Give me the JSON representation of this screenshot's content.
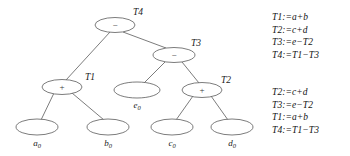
{
  "figure": {
    "kind": "expression-tree-with-code",
    "background": "#ffffff",
    "stroke_color": "#5a5a5a",
    "text_color": "#1a1a1a"
  },
  "tree": {
    "nodes": [
      {
        "id": "T4",
        "operator": "−",
        "tag": "T4",
        "cx": 115,
        "cy": 25,
        "rx": 20,
        "ry": 7.5,
        "tag_x": 133,
        "tag_y": 15,
        "kind": "operator"
      },
      {
        "id": "T3",
        "operator": "−",
        "tag": "T3",
        "cx": 174,
        "cy": 55,
        "rx": 21,
        "ry": 7.5,
        "tag_x": 191,
        "tag_y": 46,
        "kind": "operator"
      },
      {
        "id": "T1",
        "operator": "+",
        "tag": "T1",
        "cx": 62,
        "cy": 87,
        "rx": 20,
        "ry": 7.5,
        "tag_x": 85,
        "tag_y": 80,
        "kind": "operator"
      },
      {
        "id": "T2",
        "operator": "+",
        "tag": "T2",
        "cx": 202,
        "cy": 90,
        "rx": 20,
        "ry": 7.5,
        "tag_x": 221,
        "tag_y": 83,
        "kind": "operator"
      },
      {
        "id": "e0",
        "operator": "",
        "tag": "",
        "cx": 137,
        "cy": 90,
        "rx": 23,
        "ry": 8,
        "label": "e",
        "sub": "0",
        "label_x": 137,
        "label_y": 108,
        "kind": "leaf"
      },
      {
        "id": "a0",
        "operator": "",
        "tag": "",
        "cx": 37,
        "cy": 127,
        "rx": 21,
        "ry": 8,
        "label": "a",
        "sub": "0",
        "label_x": 37,
        "label_y": 146,
        "kind": "leaf"
      },
      {
        "id": "b0",
        "operator": "",
        "tag": "",
        "cx": 108,
        "cy": 127,
        "rx": 21,
        "ry": 8,
        "label": "b",
        "sub": "0",
        "label_x": 108,
        "label_y": 146,
        "kind": "leaf"
      },
      {
        "id": "c0",
        "operator": "",
        "tag": "",
        "cx": 172,
        "cy": 127,
        "rx": 21,
        "ry": 8,
        "label": "c",
        "sub": "0",
        "label_x": 172,
        "label_y": 146,
        "kind": "leaf"
      },
      {
        "id": "d0",
        "operator": "",
        "tag": "",
        "cx": 232,
        "cy": 127,
        "rx": 21,
        "ry": 8,
        "label": "d",
        "sub": "0",
        "label_x": 232,
        "label_y": 146,
        "kind": "leaf"
      }
    ],
    "edges": [
      {
        "from": "T4",
        "to": "T1",
        "x1": 110,
        "y1": 32,
        "x2": 66,
        "y2": 80
      },
      {
        "from": "T4",
        "to": "T3",
        "x1": 123,
        "y1": 32,
        "x2": 166,
        "y2": 48
      },
      {
        "from": "T3",
        "to": "e0",
        "x1": 165,
        "y1": 62,
        "x2": 144,
        "y2": 83
      },
      {
        "from": "T3",
        "to": "T2",
        "x1": 182,
        "y1": 62,
        "x2": 199,
        "y2": 83
      },
      {
        "from": "T1",
        "to": "a0",
        "x1": 54,
        "y1": 93,
        "x2": 41,
        "y2": 120
      },
      {
        "from": "T1",
        "to": "b0",
        "x1": 72,
        "y1": 93,
        "x2": 104,
        "y2": 120
      },
      {
        "from": "T2",
        "to": "c0",
        "x1": 193,
        "y1": 96,
        "x2": 176,
        "y2": 120
      },
      {
        "from": "T2",
        "to": "d0",
        "x1": 211,
        "y1": 96,
        "x2": 228,
        "y2": 120
      }
    ]
  },
  "code_blocks": {
    "top": {
      "name": "first-code-listing",
      "lines": [
        "T1:=a+b",
        "T2:=c+d",
        "T3:=e−T2",
        "T4:=T1−T3"
      ]
    },
    "bottom": {
      "name": "second-code-listing",
      "lines": [
        "T2:=c+d",
        "T3:=e−T2",
        "T1:=a+b",
        "T4:=T1−T3"
      ]
    }
  }
}
